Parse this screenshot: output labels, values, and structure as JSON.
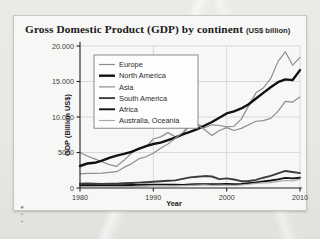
{
  "chart_data": {
    "type": "line",
    "title": "Gross Domestic Product (GDP) by continent",
    "title_unit": "(US$ billion)",
    "xlabel": "Year",
    "ylabel": "GDP (Billion US$)",
    "xlim": [
      1980,
      2010
    ],
    "ylim": [
      0,
      20000
    ],
    "xticks": [
      1980,
      1990,
      2000,
      2010
    ],
    "xtick_labels": [
      "1980",
      "1990",
      "2000",
      "2010"
    ],
    "yticks": [
      0,
      5000,
      10000,
      15000,
      20000
    ],
    "ytick_labels": [
      "0",
      "5000",
      "10.000",
      "15.000",
      "20.000"
    ],
    "grid": true,
    "legend_position": "top-left-inside",
    "x": [
      1980,
      1981,
      1982,
      1983,
      1984,
      1985,
      1986,
      1987,
      1988,
      1989,
      1990,
      1991,
      1992,
      1993,
      1994,
      1995,
      1996,
      1997,
      1998,
      1999,
      2000,
      2001,
      2002,
      2003,
      2004,
      2005,
      2006,
      2007,
      2008,
      2009,
      2010
    ],
    "series": [
      {
        "name": "Europe",
        "color": "#8e8e8e",
        "width": 1.2,
        "values": [
          5000,
          4500,
          4100,
          3700,
          3300,
          3050,
          3900,
          4900,
          5600,
          5800,
          6900,
          7200,
          7800,
          7200,
          7600,
          8900,
          9000,
          8500,
          8900,
          8800,
          8600,
          8700,
          9700,
          11600,
          13400,
          14100,
          15400,
          17800,
          19200,
          17300,
          18400
        ]
      },
      {
        "name": "North America",
        "color": "#111111",
        "width": 2.4,
        "values": [
          3100,
          3450,
          3550,
          3850,
          4250,
          4550,
          4800,
          5100,
          5500,
          5900,
          6200,
          6400,
          6750,
          7100,
          7550,
          7900,
          8300,
          8800,
          9300,
          9900,
          10500,
          10800,
          11200,
          11800,
          12600,
          13400,
          14200,
          14900,
          15300,
          15200,
          16600
        ]
      },
      {
        "name": "Asia",
        "color": "#8e8e8e",
        "width": 1.2,
        "values": [
          2000,
          2050,
          2050,
          2100,
          2200,
          2300,
          2900,
          3400,
          4100,
          4400,
          4900,
          5600,
          6200,
          7000,
          7800,
          9000,
          8900,
          8200,
          7400,
          8100,
          8500,
          8100,
          8400,
          8900,
          9400,
          9500,
          9800,
          10800,
          12200,
          12100,
          12800
        ]
      },
      {
        "name": "South America",
        "color": "#3c3c3c",
        "width": 1.9,
        "values": [
          620,
          640,
          620,
          580,
          590,
          600,
          660,
          700,
          750,
          810,
          880,
          950,
          1020,
          1080,
          1280,
          1500,
          1580,
          1680,
          1620,
          1250,
          1350,
          1200,
          960,
          980,
          1150,
          1450,
          1700,
          2050,
          2400,
          2250,
          2100
        ]
      },
      {
        "name": "Africa",
        "color": "#111111",
        "width": 1.9,
        "values": [
          380,
          390,
          380,
          370,
          370,
          370,
          400,
          420,
          440,
          450,
          480,
          470,
          470,
          450,
          440,
          500,
          530,
          540,
          530,
          530,
          560,
          550,
          580,
          680,
          800,
          930,
          1060,
          1220,
          1420,
          1350,
          1450
        ]
      },
      {
        "name": "Australia, Oceania",
        "color": "#a8a8a8",
        "width": 1.2,
        "values": [
          180,
          180,
          180,
          175,
          185,
          180,
          190,
          200,
          230,
          260,
          290,
          300,
          300,
          300,
          330,
          370,
          420,
          430,
          390,
          410,
          400,
          370,
          420,
          530,
          650,
          730,
          770,
          930,
          1060,
          1000,
          1260
        ]
      }
    ]
  }
}
